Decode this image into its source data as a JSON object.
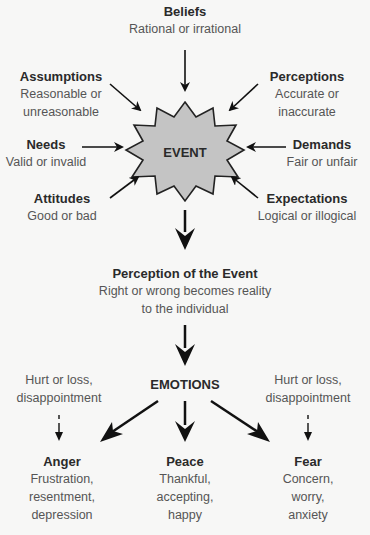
{
  "diagram": {
    "center": {
      "label": "EVENT",
      "shape": "starburst",
      "fill_color": "#c4c4c4",
      "stroke_color": "#222222"
    },
    "inputs": [
      {
        "id": "beliefs",
        "title": "Beliefs",
        "sub": [
          "Rational or irrational"
        ]
      },
      {
        "id": "assumptions",
        "title": "Assumptions",
        "sub": [
          "Reasonable or",
          "unreasonable"
        ]
      },
      {
        "id": "perceptions",
        "title": "Perceptions",
        "sub": [
          "Accurate or",
          "inaccurate"
        ]
      },
      {
        "id": "needs",
        "title": "Needs",
        "sub": [
          "Valid or invalid"
        ]
      },
      {
        "id": "demands",
        "title": "Demands",
        "sub": [
          "Fair or unfair"
        ]
      },
      {
        "id": "attitudes",
        "title": "Attitudes",
        "sub": [
          "Good or bad"
        ]
      },
      {
        "id": "expectations",
        "title": "Expectations",
        "sub": [
          "Logical or illogical"
        ]
      }
    ],
    "perception_of_event": {
      "title": "Perception of the Event",
      "sub": [
        "Right or wrong becomes reality",
        "to the individual"
      ]
    },
    "emotions": {
      "label": "EMOTIONS",
      "side_notes": {
        "left": [
          "Hurt or loss,",
          "disappointment"
        ],
        "right": [
          "Hurt or loss,",
          "disappointment"
        ]
      },
      "outcomes": [
        {
          "id": "anger",
          "title": "Anger",
          "sub": [
            "Frustration,",
            "resentment,",
            "depression"
          ]
        },
        {
          "id": "peace",
          "title": "Peace",
          "sub": [
            "Thankful,",
            "accepting,",
            "happy"
          ]
        },
        {
          "id": "fear",
          "title": "Fear",
          "sub": [
            "Concern,",
            "worry,",
            "anxiety"
          ]
        }
      ]
    },
    "colors": {
      "background": "#f7f7f6",
      "arrow": "#111111",
      "title_text": "#2a2a2a",
      "sub_text": "#555555"
    }
  }
}
